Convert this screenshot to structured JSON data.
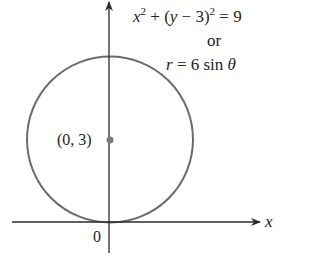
{
  "diagram": {
    "type": "polar-circle-plot",
    "equation_cartesian": {
      "x": "x",
      "sq1": "2",
      "plus_open": " + (",
      "y": "y",
      "minus_three": " − 3)",
      "sq2": "2",
      "equals_nine": " = 9"
    },
    "connector": "or",
    "equation_polar": {
      "r": "r",
      "rest": " = 6 sin ",
      "theta": "θ"
    },
    "center_label": "(0, 3)",
    "origin_label": "0",
    "x_axis_label": "x",
    "colors": {
      "circle": "#6b6b6b",
      "axes": "#2b2b2b",
      "center_point": "#7a7a7a",
      "text": "#222222"
    },
    "geometry": {
      "center": [
        0,
        3
      ],
      "radius": 3
    }
  }
}
